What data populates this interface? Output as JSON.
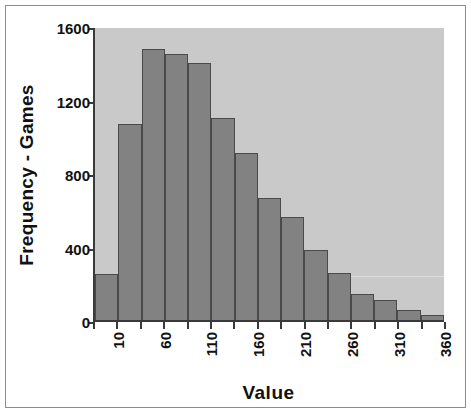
{
  "chart_data": {
    "type": "bar",
    "title": "",
    "subtitle": "",
    "xlabel": "Value",
    "ylabel": "Frequency - Games",
    "categories": [
      "10",
      "35",
      "60",
      "85",
      "110",
      "135",
      "160",
      "185",
      "210",
      "235",
      "260",
      "285",
      "310",
      "335",
      "360"
    ],
    "values": [
      250,
      1075,
      1485,
      1455,
      1410,
      1105,
      915,
      670,
      565,
      385,
      260,
      140,
      110,
      55,
      25
    ],
    "xtick_labels": [
      "10",
      "",
      "60",
      "",
      "110",
      "",
      "160",
      "",
      "210",
      "",
      "260",
      "",
      "310",
      "",
      "360"
    ],
    "xtick_labels_shown": [
      "10",
      "60",
      "110",
      "160",
      "210",
      "260",
      "310",
      "360"
    ],
    "ytick_labels": [
      "0",
      "400",
      "800",
      "1200",
      "1600"
    ],
    "ytick_values": [
      0,
      400,
      800,
      1200,
      1600
    ],
    "ylim": [
      0,
      1600
    ],
    "grid": false,
    "legend": "none",
    "bar_color": "#828282",
    "bar_border_color": "#4a4a4a",
    "plot_background": "#c9c9c9",
    "axis_color": "#3a3a3a",
    "text_color": "#111111",
    "figure_background": "#ffffff"
  },
  "axes": {
    "x_title": "Value",
    "y_title": "Frequency - Games"
  }
}
